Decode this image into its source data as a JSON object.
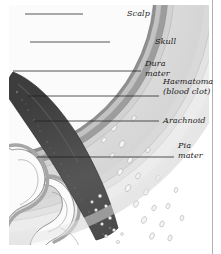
{
  "figure": {
    "labels": [
      {
        "id": "scalp",
        "text": "Scalp",
        "line2": ""
      },
      {
        "id": "skull",
        "text": "Skull",
        "line2": ""
      },
      {
        "id": "dura",
        "text": "Dura",
        "line2": "mater"
      },
      {
        "id": "haematoma",
        "text": "Haematoma",
        "line2": "(blood clot)"
      },
      {
        "id": "arachnoid",
        "text": "Arachnoid",
        "line2": ""
      },
      {
        "id": "pia",
        "text": "Pia",
        "line2": "mater"
      }
    ]
  },
  "colors": {
    "page": "#ffffff",
    "scalp_outer": "#f0f0f0",
    "scalp_inner": "#e3e3e3",
    "skull_outer_table": "#d7d7d7",
    "skull_diploe": "#cfcfcf",
    "dura": "#9a9a9a",
    "haematoma": "#4a4a4a",
    "arachnoid": "#b5b5b5",
    "pia": "#8e8e8e",
    "brain_surface": "#fbfbfb",
    "brain_tissue": "#a9a9a9",
    "leader_line": "#1d1d1d",
    "border_rule": "#b0b0b0"
  },
  "leaders": [
    {
      "id": "scalp",
      "x1": 25,
      "y1": 14,
      "x2": 83,
      "y2": 14
    },
    {
      "id": "skull",
      "x1": 30,
      "y1": 42,
      "x2": 110,
      "y2": 42
    },
    {
      "id": "dura",
      "x1": 13,
      "y1": 71,
      "x2": 141,
      "y2": 71
    },
    {
      "id": "haematoma",
      "x1": 28,
      "y1": 96,
      "x2": 159,
      "y2": 96
    },
    {
      "id": "arachnoid",
      "x1": 34,
      "y1": 121,
      "x2": 159,
      "y2": 121
    },
    {
      "id": "pia",
      "x1": 37,
      "y1": 157,
      "x2": 174,
      "y2": 157
    }
  ]
}
